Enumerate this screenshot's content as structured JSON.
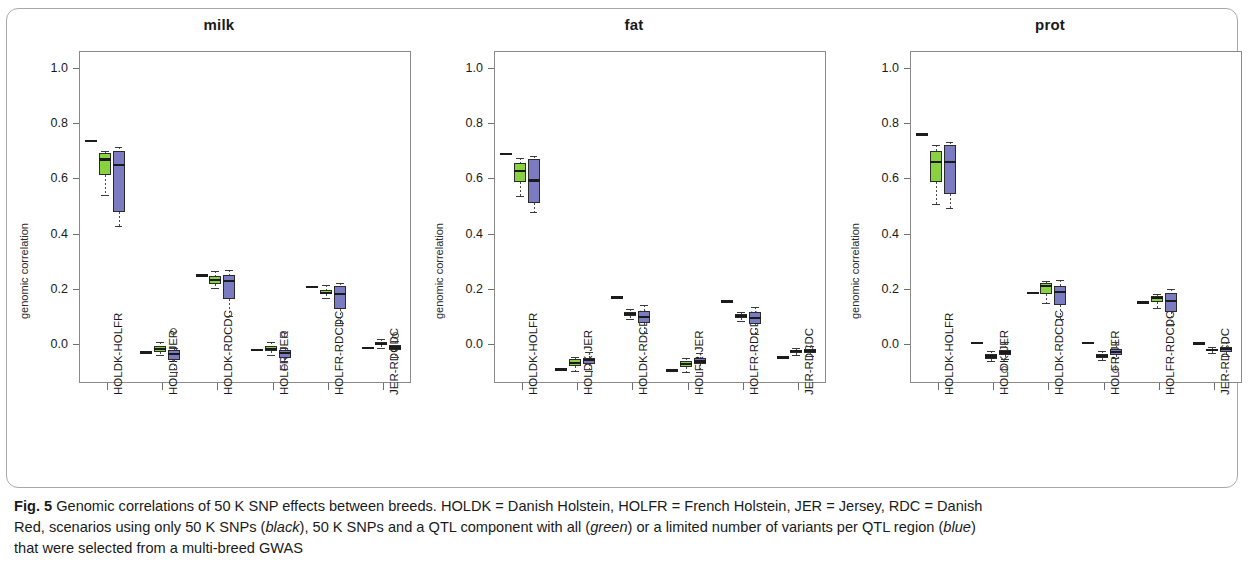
{
  "figure": {
    "caption_label": "Fig. 5",
    "caption_line1": "Genomic correlations of 50 K SNP effects between breeds. HOLDK = Danish Holstein, HOLFR = French Holstein, JER = Jersey, RDC = Danish",
    "caption_line2_a": "Red, scenarios using only 50 K SNPs (",
    "caption_black": "black",
    "caption_line2_b": "), 50 K SNPs and a QTL component with all (",
    "caption_green": "green",
    "caption_line2_c": ") or a limited number of variants per QTL region (",
    "caption_blue": "blue",
    "caption_line2_d": ")",
    "caption_line3": "that were selected from a multi-breed GWAS"
  },
  "colors": {
    "green": "#8ad13f",
    "blue": "#7b7bc2",
    "black": "#1c1c1c",
    "axis": "#6f6f6f",
    "frame": "#a8a8a8"
  },
  "chart_data": {
    "type": "box",
    "title": "Genomic correlations of 50 K SNP effects between breeds",
    "xlabel": "",
    "ylabel": "genomic correlation",
    "ylim": [
      -0.14,
      1.06
    ],
    "yticks": [
      0.0,
      0.2,
      0.4,
      0.6,
      0.8,
      1.0
    ],
    "ytick_labels": [
      "0.0",
      "0.2",
      "0.4",
      "0.6",
      "0.8",
      "1.0"
    ],
    "grid": false,
    "legend": [
      "black",
      "green",
      "blue"
    ],
    "legend_position": "caption",
    "categories": [
      "HOLDK-HOLFR",
      "HOLDK-JER",
      "HOLDK-RDCDC",
      "HOLFR-JER",
      "HOLFR-RDCDC",
      "JER-RDCDC"
    ],
    "panels": [
      {
        "name": "milk",
        "groups": [
          {
            "category": "HOLDK-HOLFR",
            "black": {
              "value": 0.735
            },
            "green": {
              "low": 0.538,
              "q1": 0.612,
              "median": 0.668,
              "q3": 0.69,
              "high": 0.7,
              "outliers": []
            },
            "blue": {
              "low": 0.428,
              "q1": 0.477,
              "median": 0.648,
              "q3": 0.7,
              "high": 0.712,
              "outliers": []
            }
          },
          {
            "category": "HOLDK-JER",
            "black": {
              "value": -0.03
            },
            "green": {
              "low": -0.04,
              "q1": -0.028,
              "median": -0.017,
              "q3": -0.007,
              "high": 0.008,
              "outliers": []
            },
            "blue": {
              "low": -0.102,
              "q1": -0.057,
              "median": -0.035,
              "q3": -0.02,
              "high": -0.012,
              "outliers": [
                0.046
              ]
            }
          },
          {
            "category": "HOLDK-RDCDC",
            "black": {
              "value": 0.248
            },
            "green": {
              "low": 0.205,
              "q1": 0.218,
              "median": 0.231,
              "q3": 0.245,
              "high": 0.265,
              "outliers": []
            },
            "blue": {
              "low": 0.102,
              "q1": 0.163,
              "median": 0.228,
              "q3": 0.252,
              "high": 0.268,
              "outliers": []
            }
          },
          {
            "category": "HOLFR-JER",
            "black": {
              "value": -0.02
            },
            "green": {
              "low": -0.037,
              "q1": -0.026,
              "median": -0.016,
              "q3": -0.008,
              "high": 0.007,
              "outliers": []
            },
            "blue": {
              "low": -0.062,
              "q1": -0.05,
              "median": -0.032,
              "q3": -0.02,
              "high": -0.012,
              "outliers": [
                0.035,
                -0.083
              ]
            }
          },
          {
            "category": "HOLFR-RDCDC",
            "black": {
              "value": 0.207
            },
            "green": {
              "low": 0.168,
              "q1": 0.18,
              "median": 0.186,
              "q3": 0.196,
              "high": 0.215,
              "outliers": []
            },
            "blue": {
              "low": 0.077,
              "q1": 0.126,
              "median": 0.183,
              "q3": 0.212,
              "high": 0.222,
              "outliers": []
            }
          },
          {
            "category": "JER-RDCDC",
            "black": {
              "value": -0.014
            },
            "green": {
              "low": -0.012,
              "q1": -0.004,
              "median": 0.001,
              "q3": 0.007,
              "high": 0.018,
              "outliers": []
            },
            "blue": {
              "low": -0.045,
              "q1": -0.022,
              "median": -0.012,
              "q3": -0.004,
              "high": 0.012,
              "outliers": [
                0.032
              ]
            }
          }
        ]
      },
      {
        "name": "fat",
        "groups": [
          {
            "category": "HOLDK-HOLFR",
            "black": {
              "value": 0.688
            },
            "green": {
              "low": 0.537,
              "q1": 0.588,
              "median": 0.625,
              "q3": 0.655,
              "high": 0.672,
              "outliers": []
            },
            "blue": {
              "low": 0.478,
              "q1": 0.512,
              "median": 0.592,
              "q3": 0.67,
              "high": 0.68,
              "outliers": []
            }
          },
          {
            "category": "HOLDK-JER",
            "black": {
              "value": -0.092
            },
            "green": {
              "low": -0.097,
              "q1": -0.08,
              "median": -0.068,
              "q3": -0.055,
              "high": -0.045,
              "outliers": []
            },
            "blue": {
              "low": -0.098,
              "q1": -0.07,
              "median": -0.058,
              "q3": -0.048,
              "high": -0.028,
              "outliers": []
            }
          },
          {
            "category": "HOLDK-RDCDC",
            "black": {
              "value": 0.17
            },
            "green": {
              "low": 0.09,
              "q1": 0.102,
              "median": 0.11,
              "q3": 0.118,
              "high": 0.128,
              "outliers": []
            },
            "blue": {
              "low": 0.042,
              "q1": 0.076,
              "median": 0.1,
              "q3": 0.12,
              "high": 0.142,
              "outliers": []
            }
          },
          {
            "category": "HOLFR-JER",
            "black": {
              "value": -0.095
            },
            "green": {
              "low": -0.1,
              "q1": -0.082,
              "median": -0.072,
              "q3": -0.06,
              "high": -0.05,
              "outliers": []
            },
            "blue": {
              "low": -0.1,
              "q1": -0.073,
              "median": -0.062,
              "q3": -0.05,
              "high": -0.032,
              "outliers": []
            }
          },
          {
            "category": "HOLFR-RDCDC",
            "black": {
              "value": 0.155
            },
            "green": {
              "low": 0.085,
              "q1": 0.094,
              "median": 0.101,
              "q3": 0.108,
              "high": 0.115,
              "outliers": []
            },
            "blue": {
              "low": 0.036,
              "q1": 0.073,
              "median": 0.095,
              "q3": 0.115,
              "high": 0.135,
              "outliers": []
            }
          },
          {
            "category": "JER-RDCDC",
            "black": {
              "value": -0.048
            },
            "green": {
              "low": -0.038,
              "q1": -0.03,
              "median": -0.025,
              "q3": -0.02,
              "high": -0.013,
              "outliers": []
            },
            "blue": {
              "low": -0.043,
              "q1": -0.03,
              "median": -0.024,
              "q3": -0.018,
              "high": -0.008,
              "outliers": []
            }
          }
        ]
      },
      {
        "name": "prot",
        "groups": [
          {
            "category": "HOLDK-HOLFR",
            "black": {
              "value": 0.758
            },
            "green": {
              "low": 0.508,
              "q1": 0.585,
              "median": 0.66,
              "q3": 0.7,
              "high": 0.722,
              "outliers": []
            },
            "blue": {
              "low": 0.492,
              "q1": 0.542,
              "median": 0.658,
              "q3": 0.722,
              "high": 0.73,
              "outliers": []
            }
          },
          {
            "category": "HOLDK-JER",
            "black": {
              "value": 0.005
            },
            "green": {
              "low": -0.06,
              "q1": -0.052,
              "median": -0.044,
              "q3": -0.036,
              "high": -0.026,
              "outliers": []
            },
            "blue": {
              "low": -0.052,
              "q1": -0.04,
              "median": -0.03,
              "q3": -0.02,
              "high": 0.008,
              "outliers": [
                -0.092
              ]
            }
          },
          {
            "category": "HOLDK-RDCDC",
            "black": {
              "value": 0.186
            },
            "green": {
              "low": 0.15,
              "q1": 0.18,
              "median": 0.21,
              "q3": 0.22,
              "high": 0.228,
              "outliers": []
            },
            "blue": {
              "low": 0.092,
              "q1": 0.142,
              "median": 0.188,
              "q3": 0.212,
              "high": 0.232,
              "outliers": []
            }
          },
          {
            "category": "HOLFR-JER",
            "black": {
              "value": 0.005
            },
            "green": {
              "low": -0.058,
              "q1": -0.05,
              "median": -0.042,
              "q3": -0.034,
              "high": -0.026,
              "outliers": []
            },
            "blue": {
              "low": -0.05,
              "q1": -0.038,
              "median": -0.028,
              "q3": -0.018,
              "high": 0.01,
              "outliers": [
                -0.09
              ]
            }
          },
          {
            "category": "HOLFR-RDCDC",
            "black": {
              "value": 0.152
            },
            "green": {
              "low": 0.132,
              "q1": 0.152,
              "median": 0.168,
              "q3": 0.176,
              "high": 0.182,
              "outliers": []
            },
            "blue": {
              "low": 0.075,
              "q1": 0.118,
              "median": 0.155,
              "q3": 0.185,
              "high": 0.198,
              "outliers": []
            }
          },
          {
            "category": "JER-RDCDC",
            "black": {
              "value": 0.003
            },
            "green": {
              "low": -0.03,
              "q1": -0.024,
              "median": -0.02,
              "q3": -0.016,
              "high": -0.01,
              "outliers": []
            },
            "blue": {
              "low": -0.043,
              "q1": -0.028,
              "median": -0.018,
              "q3": -0.01,
              "high": 0.01,
              "outliers": []
            }
          }
        ]
      }
    ]
  }
}
